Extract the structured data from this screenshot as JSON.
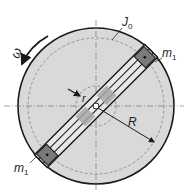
{
  "diagram": {
    "type": "rotating disk with sliding masses",
    "labels": {
      "disk_inertia": "J",
      "disk_inertia_sub": "0",
      "mass_top": "m",
      "mass_top_sub": "1",
      "mass_bottom": "m",
      "mass_bottom_sub": "1",
      "angular_velocity": "ω",
      "inner_radius": "r",
      "outer_radius": "R"
    },
    "colors": {
      "disk_fill": "#d9d9d9",
      "outline": "#1a1a1a",
      "mass_fill": "#7a7a7a",
      "inner_block_fill": "#a8a8a8",
      "background": "#ffffff"
    }
  }
}
